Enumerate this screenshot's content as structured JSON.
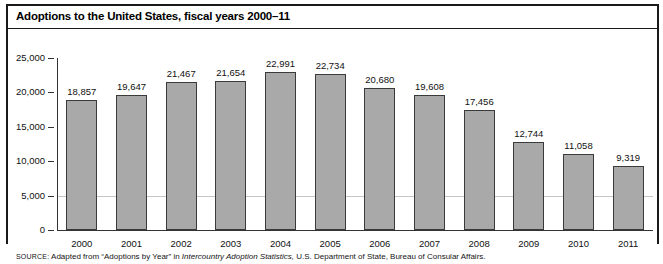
{
  "figure": {
    "title": "Adoptions to the United States, fiscal years 2000–11",
    "source_prefix": "SOURCE:",
    "source_text_1": " Adapted from “Adoptions by Year” in ",
    "source_italic": "Intercountry Adoption Statistics,",
    "source_text_2": " U.S. Department of State, Bureau of Consular Affairs."
  },
  "chart_data": {
    "type": "bar",
    "title": "Adoptions to the United States, fiscal years 2000–11",
    "xlabel": "",
    "ylabel": "",
    "ylim": [
      0,
      25000
    ],
    "ytick_values": [
      0,
      5000,
      10000,
      15000,
      20000,
      25000
    ],
    "ytick_labels": [
      "0",
      "5,000",
      "10,000",
      "15,000",
      "20,000",
      "25,000"
    ],
    "grid": false,
    "legend": "none",
    "categories": [
      "2000",
      "2001",
      "2002",
      "2003",
      "2004",
      "2005",
      "2006",
      "2007",
      "2008",
      "2009",
      "2010",
      "2011"
    ],
    "values": [
      18857,
      19647,
      21467,
      21654,
      22991,
      22734,
      20680,
      19608,
      17456,
      12744,
      11058,
      9319
    ],
    "value_labels": [
      "18,857",
      "19,647",
      "21,467",
      "21,654",
      "22,991",
      "22,734",
      "20,680",
      "19,608",
      "17,456",
      "12,744",
      "11,058",
      "9,319"
    ],
    "bar_color": "#a9a9a9",
    "bar_edge_color": "#3a3a3a"
  }
}
